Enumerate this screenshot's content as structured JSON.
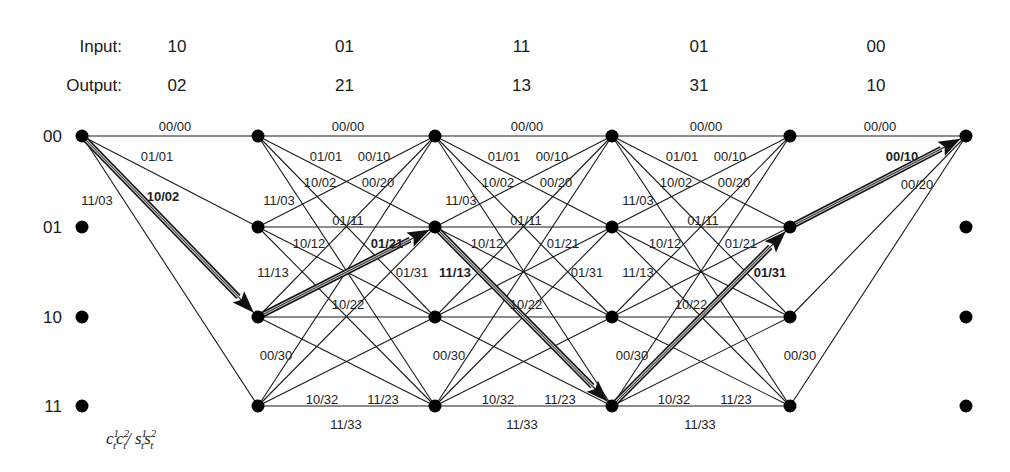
{
  "header": {
    "input_label": "Input:",
    "output_label": "Output:",
    "inputs": [
      "10",
      "01",
      "11",
      "01",
      "00"
    ],
    "outputs": [
      "02",
      "21",
      "13",
      "31",
      "10"
    ]
  },
  "states": [
    "00",
    "01",
    "10",
    "11"
  ],
  "legend": {
    "c": "c",
    "s": "s",
    "t": "t",
    "sep": "/"
  },
  "layout": {
    "column_x": [
      82,
      258,
      435,
      612,
      790,
      966
    ],
    "row_y": [
      136,
      227,
      317,
      406
    ]
  },
  "stages": [
    {
      "edges": [
        [
          0,
          0
        ],
        [
          0,
          1
        ],
        [
          0,
          2
        ],
        [
          0,
          3
        ]
      ],
      "labels": [
        {
          "text": "00/00",
          "x": 175,
          "y": 127
        },
        {
          "text": "01/01",
          "x": 157,
          "y": 157
        },
        {
          "text": "10/02",
          "x": 163,
          "y": 197,
          "bold": true
        },
        {
          "text": "11/03",
          "x": 97,
          "y": 201
        }
      ]
    },
    {
      "edges": "full",
      "labels": [
        {
          "text": "00/00",
          "x": 348,
          "y": 127
        },
        {
          "text": "01/01",
          "x": 326,
          "y": 157
        },
        {
          "text": "00/10",
          "x": 374,
          "y": 157
        },
        {
          "text": "10/02",
          "x": 320,
          "y": 183
        },
        {
          "text": "00/20",
          "x": 378,
          "y": 183
        },
        {
          "text": "11/03",
          "x": 279,
          "y": 201
        },
        {
          "text": "01/11",
          "x": 348,
          "y": 221
        },
        {
          "text": "10/12",
          "x": 309,
          "y": 244
        },
        {
          "text": "01/21",
          "x": 387,
          "y": 244,
          "bold": true
        },
        {
          "text": "11/13",
          "x": 273,
          "y": 273
        },
        {
          "text": "01/31",
          "x": 412,
          "y": 273
        },
        {
          "text": "10/22",
          "x": 348,
          "y": 305
        },
        {
          "text": "00/30",
          "x": 276,
          "y": 356
        },
        {
          "text": "10/32",
          "x": 322,
          "y": 400
        },
        {
          "text": "11/23",
          "x": 383,
          "y": 400
        },
        {
          "text": "11/33",
          "x": 346,
          "y": 425
        }
      ]
    },
    {
      "edges": "full",
      "labels": [
        {
          "text": "00/00",
          "x": 527,
          "y": 127
        },
        {
          "text": "01/01",
          "x": 504,
          "y": 157
        },
        {
          "text": "00/10",
          "x": 552,
          "y": 157
        },
        {
          "text": "10/02",
          "x": 498,
          "y": 183
        },
        {
          "text": "00/20",
          "x": 556,
          "y": 183
        },
        {
          "text": "11/03",
          "x": 461,
          "y": 201
        },
        {
          "text": "01/11",
          "x": 526,
          "y": 221
        },
        {
          "text": "10/12",
          "x": 487,
          "y": 244
        },
        {
          "text": "01/21",
          "x": 563,
          "y": 244
        },
        {
          "text": "11/13",
          "x": 455,
          "y": 273,
          "bold": true
        },
        {
          "text": "01/31",
          "x": 587,
          "y": 273
        },
        {
          "text": "10/22",
          "x": 526,
          "y": 305
        },
        {
          "text": "00/30",
          "x": 449,
          "y": 356
        },
        {
          "text": "10/32",
          "x": 498,
          "y": 400
        },
        {
          "text": "11/23",
          "x": 560,
          "y": 400
        },
        {
          "text": "11/33",
          "x": 522,
          "y": 425
        }
      ]
    },
    {
      "edges": "full",
      "labels": [
        {
          "text": "00/00",
          "x": 706,
          "y": 127
        },
        {
          "text": "01/01",
          "x": 682,
          "y": 157
        },
        {
          "text": "00/10",
          "x": 730,
          "y": 157
        },
        {
          "text": "10/02",
          "x": 676,
          "y": 183
        },
        {
          "text": "00/20",
          "x": 734,
          "y": 183
        },
        {
          "text": "11/03",
          "x": 638,
          "y": 201
        },
        {
          "text": "01/11",
          "x": 703,
          "y": 221
        },
        {
          "text": "10/12",
          "x": 665,
          "y": 244
        },
        {
          "text": "01/21",
          "x": 741,
          "y": 244
        },
        {
          "text": "11/13",
          "x": 638,
          "y": 273
        },
        {
          "text": "01/31",
          "x": 770,
          "y": 273,
          "bold": true
        },
        {
          "text": "10/22",
          "x": 691,
          "y": 305
        },
        {
          "text": "00/30",
          "x": 632,
          "y": 356
        },
        {
          "text": "10/32",
          "x": 674,
          "y": 400
        },
        {
          "text": "11/23",
          "x": 736,
          "y": 400
        },
        {
          "text": "11/33",
          "x": 700,
          "y": 425
        }
      ]
    },
    {
      "edges": [
        [
          0,
          0
        ],
        [
          1,
          0
        ],
        [
          2,
          0
        ],
        [
          3,
          0
        ]
      ],
      "labels": [
        {
          "text": "00/00",
          "x": 880,
          "y": 127
        },
        {
          "text": "00/10",
          "x": 902,
          "y": 157,
          "bold": true
        },
        {
          "text": "00/20",
          "x": 917,
          "y": 185
        },
        {
          "text": "00/30",
          "x": 800,
          "y": 356
        }
      ]
    }
  ],
  "survivor_path": [
    0,
    2,
    1,
    3,
    1,
    0
  ],
  "colors": {
    "line": "#1a1a1a",
    "node": "#000000",
    "path_inner": "#bdbdbd"
  }
}
